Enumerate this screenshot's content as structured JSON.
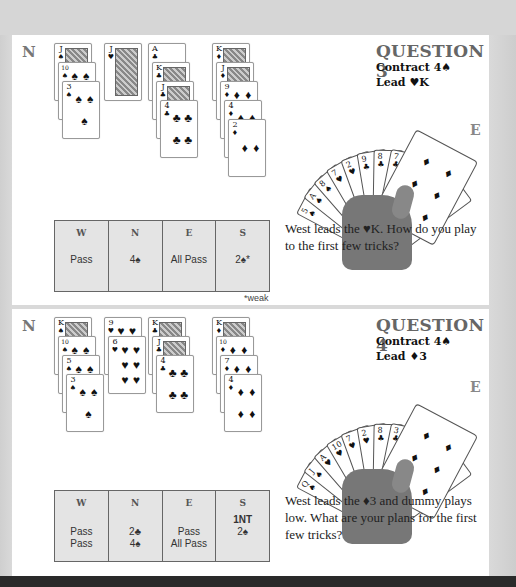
{
  "questions": [
    {
      "title": "QUESTION 3",
      "contract": "Contract 4♠",
      "lead": "Lead ♥K",
      "north_label": "N",
      "east_label": "E",
      "north_hand": {
        "spades": [
          "J",
          "10",
          "3"
        ],
        "hearts": [
          "J"
        ],
        "clubs": [
          "A",
          "K",
          "J",
          "4"
        ],
        "diamonds": [
          "K",
          "J",
          "9",
          "4",
          "2"
        ]
      },
      "east_hand": [
        "5♠",
        "A♠",
        "8♠",
        "7♥",
        "2♥",
        "9♣",
        "8♣",
        "7♣",
        "3♣",
        "9♦",
        "8♦",
        "7♦",
        "6♦"
      ],
      "auction": {
        "headers": [
          "W",
          "N",
          "E",
          "S"
        ],
        "columns": [
          [
            "Pass"
          ],
          [
            "4♠"
          ],
          [
            "All Pass"
          ],
          [
            "2♠*"
          ]
        ],
        "footnote": "*weak"
      },
      "text": "West leads the ♥K. How do you play to the first few tricks?"
    },
    {
      "title": "QUESTION 4",
      "contract": "Contract 4♠",
      "lead": "Lead ♦3",
      "north_label": "N",
      "east_label": "E",
      "north_hand": {
        "spades": [
          "K",
          "10",
          "5",
          "3"
        ],
        "hearts": [
          "9",
          "6"
        ],
        "clubs": [
          "K",
          "J",
          "4"
        ],
        "diamonds": [
          "K",
          "10",
          "7",
          "4"
        ]
      },
      "east_hand": [
        "Q♠",
        "J♠",
        "A♥",
        "10♥",
        "7♥",
        "2♥",
        "8♣",
        "3♣",
        "A♦",
        "J♦",
        "8♦",
        "6♦",
        "2♦"
      ],
      "auction": {
        "headers": [
          "W",
          "N",
          "E",
          "S"
        ],
        "columns": [
          [
            "",
            "Pass",
            "Pass"
          ],
          [
            "",
            "2♣",
            "4♠"
          ],
          [
            "",
            "Pass",
            "All Pass"
          ],
          [
            "1NT",
            "2♠",
            ""
          ]
        ],
        "footnote": ""
      },
      "text": "West leads the ♦3 and dummy plays low. What are your plans for the first few tricks?"
    }
  ],
  "colors": {
    "page_background": "#d9d9d9",
    "panel": "#ffffff",
    "auction_fill": "#e4e4e4",
    "title_gray": "#666666",
    "bottom_band": "#2a2a2a"
  }
}
